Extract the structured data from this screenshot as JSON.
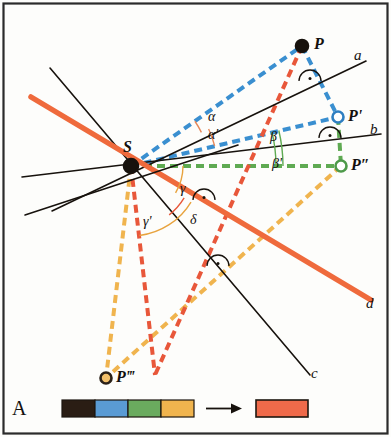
{
  "figure": {
    "panel_label": "A",
    "frame_color": "#2b2b2b",
    "background": "#fdfdfb"
  },
  "points": [
    {
      "id": "P",
      "label": "P",
      "fill": "#17120d",
      "stroke": "#17120d",
      "x": 302,
      "y": 46,
      "r": 6,
      "label_x": 314,
      "label_y": 36
    },
    {
      "id": "Pp",
      "label": "P'",
      "fill": "#ffffff",
      "stroke": "#2f7fc1",
      "x": 338,
      "y": 117,
      "r": 5.5,
      "label_x": 348,
      "label_y": 108
    },
    {
      "id": "Ppp",
      "label": "P″",
      "fill": "#ffffff",
      "stroke": "#4e9a4a",
      "x": 341,
      "y": 166,
      "r": 5.5,
      "label_x": 351,
      "label_y": 157
    },
    {
      "id": "S",
      "label": "S",
      "fill": "#17120d",
      "stroke": "#17120d",
      "x": 131,
      "y": 166,
      "r": 7,
      "label_x": 123,
      "label_y": 139
    },
    {
      "id": "Pppp",
      "label": "P‴",
      "fill": "#f3c06a",
      "stroke": "#2b2118",
      "x": 106,
      "y": 378,
      "r": 5.5,
      "label_x": 116,
      "label_y": 369
    }
  ],
  "lines": [
    {
      "id": "a",
      "label": "a",
      "color": "#17120d",
      "width": 1.6,
      "x1": 52,
      "y1": 211,
      "x2": 366,
      "y2": 61,
      "label_x": 354,
      "label_y": 48
    },
    {
      "id": "b",
      "label": "b",
      "color": "#17120d",
      "width": 1.6,
      "x1": 22,
      "y1": 177,
      "x2": 381,
      "y2": 134,
      "label_x": 370,
      "label_y": 122
    },
    {
      "id": "c",
      "label": "c",
      "color": "#17120d",
      "width": 1.6,
      "x1": 50,
      "y1": 68,
      "x2": 310,
      "y2": 375,
      "label_x": 311,
      "label_y": 366
    },
    {
      "id": "d",
      "label": "d",
      "color": "#ef6a3c",
      "width": 5.5,
      "x1": 31,
      "y1": 97,
      "x2": 371,
      "y2": 300,
      "label_x": 366,
      "label_y": 296
    },
    {
      "id": "e",
      "label": "",
      "color": "#17120d",
      "width": 1.6,
      "x1": 25,
      "y1": 215,
      "x2": 238,
      "y2": 145
    }
  ],
  "dashed_paths": [
    {
      "id": "S-P",
      "color": "#3a8fd0",
      "x1": 131,
      "y1": 166,
      "x2": 302,
      "y2": 46
    },
    {
      "id": "P-Pprime",
      "color": "#3a8fd0",
      "x1": 302,
      "y1": 46,
      "x2": 338,
      "y2": 117
    },
    {
      "id": "S-Pprime",
      "color": "#3a8fd0",
      "x1": 131,
      "y1": 166,
      "x2": 338,
      "y2": 117
    },
    {
      "id": "S-Pdouble",
      "color": "#5faa52",
      "x1": 131,
      "y1": 166,
      "x2": 341,
      "y2": 166
    },
    {
      "id": "Pp-Ppp",
      "color": "#5faa52",
      "x1": 338,
      "y1": 117,
      "x2": 341,
      "y2": 166
    },
    {
      "id": "Ppp-Pppp",
      "color": "#f0b44e",
      "x1": 341,
      "y1": 166,
      "x2": 106,
      "y2": 378
    },
    {
      "id": "S-Pppp",
      "color": "#f0b44e",
      "x1": 131,
      "y1": 166,
      "x2": 106,
      "y2": 378
    },
    {
      "id": "S-Ptrip",
      "color": "#e8573a",
      "x1": 131,
      "y1": 166,
      "x2": 155,
      "y2": 375
    },
    {
      "id": "P-Ptrip",
      "color": "#e8573a",
      "x1": 302,
      "y1": 46,
      "x2": 155,
      "y2": 375
    }
  ],
  "angles": [
    {
      "id": "alpha",
      "label": "α",
      "color": "#e8895a",
      "x": 208,
      "y": 110
    },
    {
      "id": "alpha-prime",
      "label": "α'",
      "color": "#e8895a",
      "x": 208,
      "y": 128
    },
    {
      "id": "beta",
      "label": "β",
      "color": "#5faa52",
      "x": 270,
      "y": 130
    },
    {
      "id": "beta-prime",
      "label": "β'",
      "color": "#5faa52",
      "x": 272,
      "y": 157
    },
    {
      "id": "gamma",
      "label": "γ",
      "color": "#e8895a",
      "x": 180,
      "y": 182
    },
    {
      "id": "gamma-prime",
      "label": "γ'",
      "color": "#e8a33e",
      "x": 143,
      "y": 215
    },
    {
      "id": "delta",
      "label": "δ",
      "color": "#e8573a",
      "x": 190,
      "y": 213
    }
  ],
  "right_angle_marks": [
    {
      "id": "at-line-a",
      "x": 310,
      "y": 77
    },
    {
      "id": "at-line-b",
      "x": 330,
      "y": 134
    },
    {
      "id": "at-line-d",
      "x": 204,
      "y": 196
    },
    {
      "id": "at-line-c",
      "x": 218,
      "y": 262
    }
  ],
  "legend": {
    "swatches": [
      {
        "id": "swatch-black",
        "color": "#2a1d14"
      },
      {
        "id": "swatch-blue",
        "color": "#5a9bd4"
      },
      {
        "id": "swatch-green",
        "color": "#6aab5e"
      },
      {
        "id": "swatch-orange",
        "color": "#f0b44e"
      }
    ],
    "arrow": "→",
    "result": {
      "id": "swatch-red",
      "color": "#ef6a4a"
    }
  }
}
